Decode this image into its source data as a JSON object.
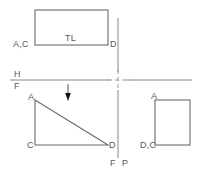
{
  "drawing": {
    "title": "Orthographic Projection — Three View Layout",
    "background_color": "#ffffff",
    "line_color": "#6b6b6b",
    "fold_line_color": "#8a8a8a",
    "text_color": "#5a5a5a",
    "arrow_color": "#111111",
    "fold_lines": {
      "horizontal": {
        "label_above": "H",
        "label_below": "F",
        "y": 80,
        "x_start": 10,
        "x_end": 192
      },
      "vertical": {
        "label_left": "F",
        "label_right": "P",
        "x": 118,
        "y_start": 18,
        "y_end": 158
      }
    },
    "views": {
      "top": {
        "name": "top-view",
        "shape": "rectangle",
        "inner_label": "TL",
        "corner_labels": {
          "left": "A,C",
          "right": "D"
        },
        "bounds": {
          "x": 35,
          "y": 10,
          "w": 73,
          "h": 35
        }
      },
      "front": {
        "name": "front-view",
        "shape": "right-triangle",
        "vertex_labels": {
          "top_left": "A",
          "bottom_left": "C",
          "bottom_right": "D"
        },
        "bounds": {
          "x": 35,
          "y": 100,
          "w": 73,
          "h": 45
        }
      },
      "profile": {
        "name": "profile-view",
        "shape": "rectangle",
        "corner_labels": {
          "top_left": "A",
          "bottom_left": "D,C"
        },
        "bounds": {
          "x": 155,
          "y": 100,
          "w": 35,
          "h": 45
        }
      }
    },
    "sight_arrow": {
      "name": "line-of-sight-arrow",
      "direction": "down",
      "x": 68,
      "y_start": 84,
      "y_end": 101
    }
  }
}
